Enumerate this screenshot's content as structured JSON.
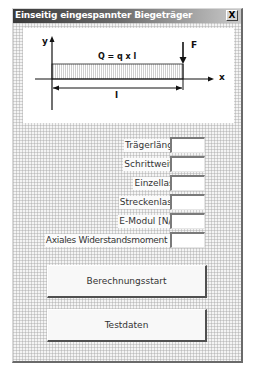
{
  "window": {
    "title": "Einseitig eingespannter Biegeträger",
    "close_label": "X"
  },
  "diagram": {
    "axis_y_label": "y",
    "axis_x_label": "x",
    "load_formula": "Q = q x l",
    "force_label": "F",
    "length_label": "l"
  },
  "form": {
    "fields": [
      {
        "label": "Trägerlänge [cm]",
        "value": ""
      },
      {
        "label": "Schrittweite [cm]",
        "value": ""
      },
      {
        "label": "Einzellast F [N]",
        "value": ""
      },
      {
        "label": "Streckenlast Q [N]",
        "value": ""
      },
      {
        "label": "E-Modul [N/cm^2]",
        "value": ""
      },
      {
        "label": "Axiales Widerstandsmoment [cm^3]",
        "value": ""
      }
    ]
  },
  "buttons": {
    "calculate": "Berechnungsstart",
    "testdata": "Testdaten"
  }
}
